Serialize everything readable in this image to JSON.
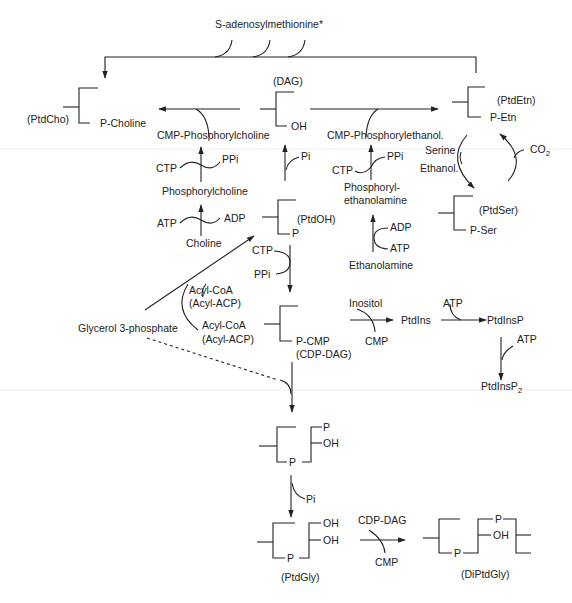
{
  "diagram": {
    "top": {
      "sam": "S-adenosylmethionine*"
    },
    "compounds": {
      "dag": "(DAG)",
      "dag_oh": "OH",
      "ptdcho": "(PtdCho)",
      "ptdcho_group": "P-Choline",
      "ptdetn": "(PtdEtn)",
      "ptdetn_group": "P-Etn",
      "ptdser": "(PtdSer)",
      "ptdser_group": "P-Ser",
      "ptdoh": "(PtdOH)",
      "ptdoh_group": "P",
      "cdpdag_group": "P-CMP",
      "cdpdag": "(CDP-DAG)",
      "pgp_p": "P",
      "pgp_oh": "OH",
      "pgp_bridge": "P",
      "ptdgly_oh1": "OH",
      "ptdgly_oh2": "OH",
      "ptdgly_bridge": "P",
      "ptdgly": "(PtdGly)",
      "diptdgly_p1": "P",
      "diptdgly_oh": "OH",
      "diptdgly_p2": "P",
      "diptdgly": "(DiPtdGly)"
    },
    "choline_branch": {
      "cmp_phosphorylcholine": "CMP-Phosphorylcholine",
      "ctp": "CTP",
      "ppi": "PPi",
      "phosphorylcholine": "Phosphorylcholine",
      "atp": "ATP",
      "adp": "ADP",
      "choline": "Choline"
    },
    "ethanolamine_branch": {
      "cmp_phosphorylethanol": "CMP-Phosphorylethanol.",
      "ctp": "CTP",
      "ppi": "PPi",
      "phosphoryl_1": "Phosphoryl-",
      "phosphoryl_2": "ethanolamine",
      "adp": "ADP",
      "atp": "ATP",
      "ethanolamine": "Ethanolamine"
    },
    "serine_cycle": {
      "serine": "Serine",
      "ethanol": "Ethanol.",
      "co2": "CO",
      "co2_sub": "2"
    },
    "dag_branch": {
      "pi": "Pi"
    },
    "ptdoh_branch": {
      "ctp": "CTP",
      "ppi": "PPi"
    },
    "acyl": {
      "acyl_coa_1": "Acyl-CoA",
      "acyl_acp_1": "(Acyl-ACP)",
      "acyl_coa_2": "Acyl-CoA",
      "acyl_acp_2": "(Acyl-ACP)",
      "glycerol3p": "Glycerol 3-phosphate"
    },
    "inositol_branch": {
      "inositol": "Inositol",
      "cmp": "CMP",
      "ptdins": "PtdIns",
      "atp1": "ATP",
      "ptdinsp": "PtdInsP",
      "atp2": "ATP",
      "ptdinsp2": "PtdInsP",
      "ptdinsp2_sub": "2"
    },
    "pg_branch": {
      "pi": "Pi",
      "cdp_dag": "CDP-DAG",
      "cmp": "CMP"
    }
  }
}
